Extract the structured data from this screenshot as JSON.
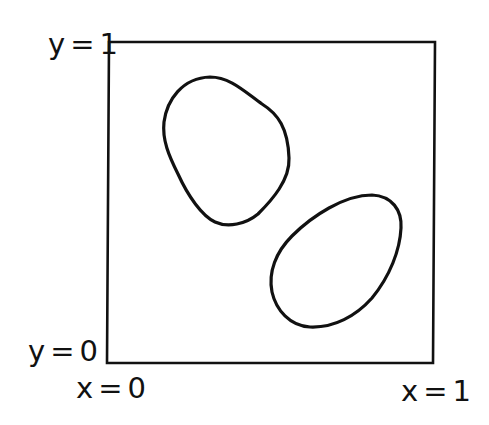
{
  "diagram": {
    "stroke_color": "#111111",
    "background_color": "#ffffff",
    "labels": {
      "y_top": {
        "var": "y",
        "eq": "=",
        "value": "1"
      },
      "y_bottom": {
        "var": "y",
        "eq": "=",
        "value": "0"
      },
      "x_left": {
        "var": "x",
        "eq": "=",
        "value": "0"
      },
      "x_right": {
        "var": "x",
        "eq": "=",
        "value": "1"
      }
    },
    "square": {
      "corners": [
        "(0,0)",
        "(1,0)",
        "(1,1)",
        "(0,1)"
      ]
    },
    "regions": [
      {
        "name": "upper-left closed curve"
      },
      {
        "name": "lower-right closed curve"
      }
    ]
  }
}
